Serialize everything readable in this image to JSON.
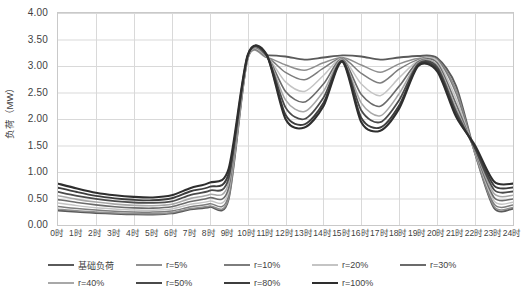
{
  "chart_data": {
    "type": "line",
    "title": "",
    "xlabel": "",
    "ylabel": "负荷（MW）",
    "ylim": [
      0,
      4
    ],
    "ytick_step": 0.5,
    "yticks": [
      "0.00",
      "0.50",
      "1.00",
      "1.50",
      "2.00",
      "2.50",
      "3.00",
      "3.50",
      "4.00"
    ],
    "xlim": [
      0,
      24
    ],
    "grid": true,
    "legend_position": "bottom",
    "x": [
      0,
      1,
      2,
      3,
      4,
      5,
      6,
      7,
      8,
      9,
      10,
      11,
      12,
      13,
      14,
      15,
      16,
      17,
      18,
      19,
      20,
      21,
      22,
      23,
      24
    ],
    "categories": [
      "0时",
      "1时",
      "2时",
      "3时",
      "4时",
      "5时",
      "6时",
      "7时",
      "8时",
      "9时",
      "10时",
      "11时",
      "12时",
      "13时",
      "14时",
      "15时",
      "16时",
      "17时",
      "18时",
      "19时",
      "20时",
      "21时",
      "22时",
      "23时",
      "24时"
    ],
    "series": [
      {
        "name": "基础负荷",
        "color": "#5a5a5a",
        "width": 1.9,
        "values": [
          0.52,
          0.46,
          0.4,
          0.36,
          0.34,
          0.33,
          0.35,
          0.45,
          0.52,
          0.7,
          3.14,
          3.2,
          3.18,
          3.12,
          3.16,
          3.2,
          3.18,
          3.12,
          3.16,
          3.19,
          3.15,
          2.62,
          1.4,
          0.6,
          0.56
        ]
      },
      {
        "name": "r=5%",
        "color": "#8f8f8f",
        "width": 1.5,
        "values": [
          0.5,
          0.44,
          0.39,
          0.35,
          0.33,
          0.32,
          0.34,
          0.44,
          0.51,
          0.68,
          3.12,
          3.16,
          3.02,
          2.92,
          3.06,
          3.16,
          3.02,
          2.88,
          3.04,
          3.14,
          3.12,
          2.55,
          1.36,
          0.58,
          0.54
        ]
      },
      {
        "name": "r=10%",
        "color": "#7d7d7d",
        "width": 1.5,
        "values": [
          0.56,
          0.49,
          0.43,
          0.39,
          0.37,
          0.36,
          0.38,
          0.48,
          0.56,
          0.75,
          3.14,
          3.17,
          2.88,
          2.74,
          2.96,
          3.15,
          2.86,
          2.68,
          2.94,
          3.12,
          3.12,
          2.48,
          1.38,
          0.62,
          0.58
        ]
      },
      {
        "name": "r=20%",
        "color": "#c4c4c4",
        "width": 1.5,
        "values": [
          0.62,
          0.54,
          0.47,
          0.43,
          0.4,
          0.39,
          0.42,
          0.53,
          0.61,
          0.82,
          3.15,
          3.18,
          2.7,
          2.52,
          2.82,
          3.14,
          2.66,
          2.44,
          2.78,
          3.1,
          3.1,
          2.38,
          1.4,
          0.66,
          0.62
        ]
      },
      {
        "name": "r=30%",
        "color": "#6b6b6b",
        "width": 1.6,
        "values": [
          0.66,
          0.58,
          0.51,
          0.46,
          0.43,
          0.42,
          0.45,
          0.57,
          0.66,
          0.88,
          3.16,
          3.19,
          2.52,
          2.32,
          2.66,
          3.13,
          2.46,
          2.24,
          2.62,
          3.08,
          3.06,
          2.28,
          1.42,
          0.7,
          0.66
        ]
      },
      {
        "name": "r=40%",
        "color": "#a8a8a8",
        "width": 1.6,
        "values": [
          0.7,
          0.61,
          0.54,
          0.49,
          0.46,
          0.45,
          0.48,
          0.61,
          0.7,
          0.94,
          3.17,
          3.2,
          2.36,
          2.14,
          2.52,
          3.12,
          2.3,
          2.06,
          2.48,
          3.06,
          3.02,
          2.2,
          1.44,
          0.74,
          0.7
        ]
      },
      {
        "name": "r=50%",
        "color": "#4a4a4a",
        "width": 1.8,
        "values": [
          0.73,
          0.64,
          0.57,
          0.52,
          0.49,
          0.48,
          0.51,
          0.65,
          0.74,
          0.99,
          3.18,
          3.2,
          2.22,
          2.0,
          2.4,
          3.1,
          2.16,
          1.94,
          2.36,
          3.04,
          2.98,
          2.14,
          1.46,
          0.77,
          0.73
        ]
      },
      {
        "name": "r=80%",
        "color": "#3d3d3d",
        "width": 1.9,
        "values": [
          0.76,
          0.67,
          0.59,
          0.54,
          0.51,
          0.5,
          0.54,
          0.68,
          0.77,
          1.03,
          3.19,
          3.21,
          2.08,
          1.9,
          2.3,
          3.09,
          2.02,
          1.84,
          2.26,
          3.02,
          2.94,
          2.08,
          1.48,
          0.8,
          0.76
        ]
      },
      {
        "name": "r=100%",
        "color": "#2e2e2e",
        "width": 2.1,
        "values": [
          0.78,
          0.69,
          0.61,
          0.56,
          0.53,
          0.52,
          0.56,
          0.7,
          0.8,
          1.06,
          3.2,
          3.22,
          2.0,
          1.84,
          2.24,
          3.08,
          1.94,
          1.78,
          2.2,
          3.0,
          2.9,
          2.04,
          1.5,
          0.82,
          0.78
        ]
      }
    ],
    "low_band": {
      "note": "lower family of curves (separate light offsets at night)",
      "values_min": [
        0.22,
        0.2,
        0.19,
        0.18,
        0.17,
        0.17,
        0.19,
        0.26,
        0.3,
        0.44,
        3.1,
        3.14,
        1.86,
        1.78,
        2.18,
        3.06,
        1.88,
        1.74,
        2.14,
        2.98,
        2.86,
        2.0,
        1.34,
        0.26,
        0.25
      ]
    }
  },
  "axes": {
    "y_title": "负荷（MW）"
  }
}
